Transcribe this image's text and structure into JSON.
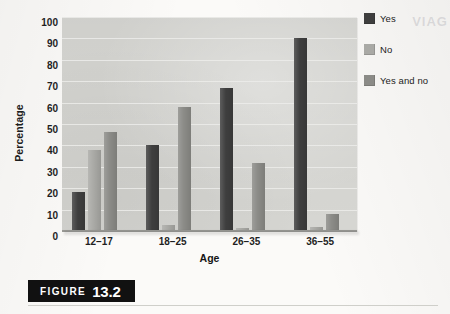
{
  "figure": {
    "caption_word": "FIGURE",
    "caption_number": "13.2",
    "ghost_text": "VIAG"
  },
  "chart_data": {
    "type": "bar",
    "title": "",
    "subtitle": "",
    "xlabel": "Age",
    "ylabel": "Percentage",
    "categories": [
      "12–17",
      "18–25",
      "26–35",
      "36–55"
    ],
    "series": [
      {
        "name": "Yes",
        "color": "#3e3e3e",
        "values": [
          18,
          40,
          67,
          90
        ]
      },
      {
        "name": "No",
        "color": "#a9a9a5",
        "values": [
          38,
          3,
          1.5,
          2
        ]
      },
      {
        "name": "Yes and no",
        "color": "#8b8b87",
        "values": [
          46.5,
          58,
          32,
          8
        ]
      }
    ],
    "ylim": [
      0,
      100
    ],
    "yticks": [
      0,
      10,
      20,
      30,
      40,
      50,
      60,
      70,
      80,
      90,
      100
    ],
    "ytick_labels": [
      "0",
      "10",
      "20",
      "30",
      "40",
      "50",
      "60",
      "70",
      "80",
      "90",
      "100"
    ],
    "grid": true,
    "grid_axis": "y",
    "legend_position": "right",
    "plot_background": "#d6d6d2"
  }
}
